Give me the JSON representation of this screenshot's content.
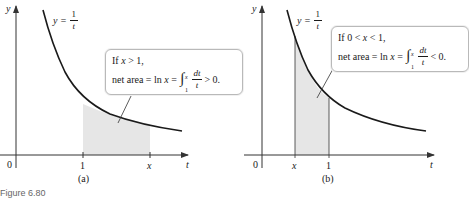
{
  "figure_label": "Figure 6.80",
  "colors": {
    "axis": "#333333",
    "curve": "#1a1a1a",
    "shade": "#e6e6e6",
    "box_border": "#b9b9b9"
  },
  "panels": [
    {
      "id": "a",
      "caption": "(a)",
      "y_axis_label": "y",
      "x_axis_label": "t",
      "origin_label": "0",
      "curve_label_lhs": "y =",
      "curve_label_num": "1",
      "curve_label_den": "t",
      "tick_labels": [
        "1",
        "x"
      ],
      "box": {
        "line1_text": "If",
        "line1_var": "x",
        "line1_rest": "> 1,",
        "line2_prefix": "net area = ln",
        "line2_var": "x",
        "line2_eq": "=",
        "upper_limit": "x",
        "lower_limit": "1",
        "integrand_num": "dt",
        "integrand_den": "t",
        "line2_suffix": "> 0."
      }
    },
    {
      "id": "b",
      "caption": "(b)",
      "y_axis_label": "y",
      "x_axis_label": "t",
      "origin_label": "0",
      "curve_label_lhs": "y =",
      "curve_label_num": "1",
      "curve_label_den": "t",
      "tick_labels": [
        "x",
        "1"
      ],
      "box": {
        "line1_text": "If 0 <",
        "line1_var": "x",
        "line1_rest": "< 1,",
        "line2_prefix": "net area = ln",
        "line2_var": "x",
        "line2_eq": "=",
        "upper_limit": "x",
        "lower_limit": "1",
        "integrand_num": "dt",
        "integrand_den": "t",
        "line2_suffix": "< 0."
      }
    }
  ]
}
